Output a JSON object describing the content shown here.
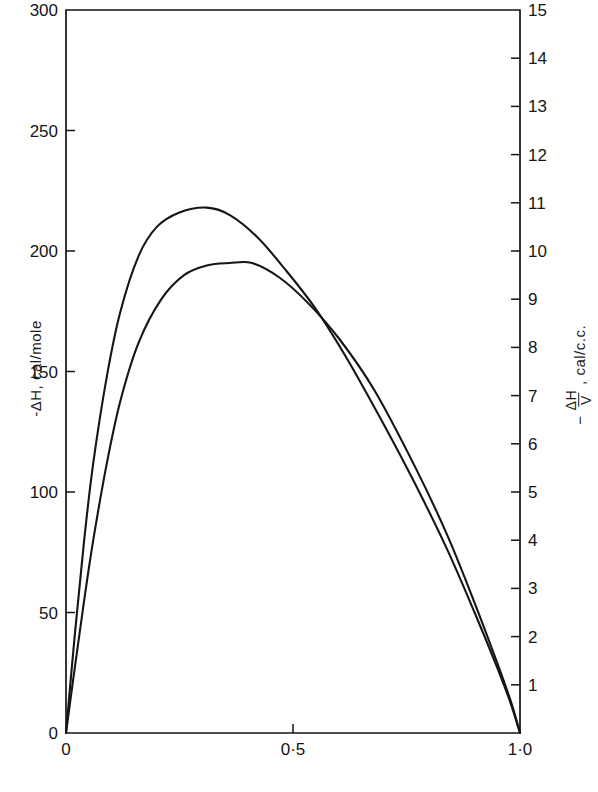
{
  "chart_data": {
    "type": "line",
    "title": "",
    "xlabel": "",
    "ylabel": "-ΔH,  cal/mole",
    "ylabel_right_prefix": "−",
    "ylabel_right_numerator": "ΔH",
    "ylabel_right_denominator": "V",
    "ylabel_right_suffix": ",  cal/c.c.",
    "grid": false,
    "legend": "none",
    "xlim": [
      0,
      1
    ],
    "ylim": [
      0,
      300
    ],
    "ylim_right": [
      0,
      15
    ],
    "xticks": [
      0,
      0.5,
      1.0
    ],
    "xticklabels": [
      "0",
      "0·5",
      "1·0"
    ],
    "yticks": [
      0,
      50,
      100,
      150,
      200,
      250,
      300
    ],
    "yticklabels": [
      "0",
      "50",
      "100",
      "150",
      "200",
      "250",
      "300"
    ],
    "yticks_right": [
      1,
      2,
      3,
      4,
      5,
      6,
      7,
      8,
      9,
      10,
      11,
      12,
      13,
      14,
      15
    ],
    "yticklabels_right": [
      "1",
      "2",
      "3",
      "4",
      "5",
      "6",
      "7",
      "8",
      "9",
      "10",
      "11",
      "12",
      "13",
      "14",
      "15"
    ],
    "line_color": "#151515",
    "series": [
      {
        "name": "upper-curve",
        "axis": "left",
        "peak_x": 0.31,
        "peak_y": 218,
        "x": [
          0.0,
          0.02,
          0.04,
          0.06,
          0.09,
          0.12,
          0.16,
          0.2,
          0.25,
          0.31,
          0.36,
          0.42,
          0.48,
          0.55,
          0.62,
          0.7,
          0.77,
          0.84,
          0.9,
          0.95,
          0.98,
          1.0
        ],
        "y": [
          0,
          42,
          80,
          112,
          148,
          175,
          198,
          210,
          216,
          218,
          215,
          206,
          193,
          176,
          155,
          128,
          103,
          76,
          50,
          27,
          12,
          0
        ]
      },
      {
        "name": "lower-curve",
        "axis": "left",
        "peak_x": 0.41,
        "peak_y": 195,
        "x": [
          0.0,
          0.02,
          0.04,
          0.06,
          0.09,
          0.12,
          0.16,
          0.21,
          0.26,
          0.31,
          0.36,
          0.41,
          0.47,
          0.53,
          0.6,
          0.68,
          0.77,
          0.84,
          0.9,
          0.95,
          0.98,
          1.0
        ],
        "y": [
          0,
          28,
          55,
          80,
          112,
          138,
          162,
          180,
          190,
          194,
          195,
          195,
          189,
          179,
          164,
          142,
          110,
          82,
          54,
          29,
          13,
          0
        ]
      }
    ]
  }
}
